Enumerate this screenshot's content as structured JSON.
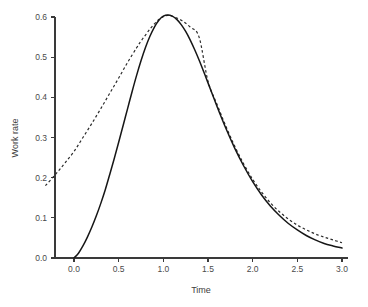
{
  "figure": {
    "background": "#ffffff",
    "width": 368,
    "height": 307
  },
  "chart_data": {
    "type": "line",
    "title": "",
    "subtitle": "",
    "xlabel": "Time",
    "ylabel": "Work rate",
    "xlim": [
      -0.32,
      3.08
    ],
    "ylim": [
      -0.012,
      0.625
    ],
    "xticks": [
      0.0,
      0.5,
      1.0,
      1.5,
      2.0,
      2.5,
      3.0
    ],
    "xticklabels": [
      "0.0",
      "0.5",
      "1.0",
      "1.5",
      "2.0",
      "2.5",
      "3.0"
    ],
    "yticks": [
      0.0,
      0.1,
      0.2,
      0.3,
      0.4,
      0.5,
      0.6
    ],
    "yticklabels": [
      "0.0",
      "0.1",
      "0.2",
      "0.3",
      "0.4",
      "0.5",
      "0.6"
    ],
    "grid": false,
    "legend": "none",
    "colors": {
      "solid": "#161616",
      "dashed": "#2b2b2b",
      "axis": "#3a3a3a",
      "text": "#4a4a4a"
    },
    "series": [
      {
        "name": "solid-curve",
        "style": "solid",
        "x": [
          0.0,
          0.05,
          0.1,
          0.15,
          0.2,
          0.25,
          0.3,
          0.35,
          0.4,
          0.45,
          0.5,
          0.55,
          0.6,
          0.65,
          0.7,
          0.75,
          0.8,
          0.85,
          0.9,
          0.95,
          1.0,
          1.05,
          1.1,
          1.15,
          1.2,
          1.25,
          1.3,
          1.35,
          1.4,
          1.45,
          1.5,
          1.6,
          1.7,
          1.8,
          1.9,
          2.0,
          2.1,
          2.2,
          2.3,
          2.4,
          2.5,
          2.6,
          2.7,
          2.8,
          2.9,
          3.0
        ],
        "y": [
          0.0,
          0.012,
          0.03,
          0.052,
          0.077,
          0.105,
          0.136,
          0.17,
          0.208,
          0.247,
          0.288,
          0.33,
          0.372,
          0.414,
          0.454,
          0.491,
          0.524,
          0.552,
          0.575,
          0.592,
          0.602,
          0.605,
          0.602,
          0.594,
          0.581,
          0.564,
          0.543,
          0.519,
          0.493,
          0.465,
          0.436,
          0.378,
          0.323,
          0.273,
          0.229,
          0.19,
          0.157,
          0.129,
          0.106,
          0.086,
          0.07,
          0.056,
          0.045,
          0.036,
          0.03,
          0.025
        ]
      },
      {
        "name": "dashed-curve",
        "style": "dashed",
        "x": [
          -0.32,
          -0.2,
          -0.1,
          0.0,
          0.1,
          0.2,
          0.3,
          0.4,
          0.5,
          0.6,
          0.7,
          0.75,
          0.8,
          0.85,
          0.9,
          0.95,
          1.0,
          1.05,
          1.1,
          1.2,
          1.3,
          1.4,
          1.5,
          1.6,
          1.7,
          1.8,
          1.9,
          2.0,
          2.1,
          2.2,
          2.3,
          2.4,
          2.5,
          2.6,
          2.7,
          2.8,
          2.9,
          3.0
        ],
        "y": [
          0.18,
          0.21,
          0.237,
          0.265,
          0.3,
          0.335,
          0.372,
          0.41,
          0.448,
          0.487,
          0.523,
          0.54,
          0.555,
          0.57,
          0.583,
          0.594,
          0.601,
          0.604,
          0.602,
          0.592,
          0.575,
          0.55,
          0.44,
          0.383,
          0.328,
          0.278,
          0.234,
          0.196,
          0.164,
          0.137,
          0.115,
          0.097,
          0.082,
          0.07,
          0.06,
          0.052,
          0.045,
          0.038
        ]
      }
    ],
    "annotations": []
  }
}
